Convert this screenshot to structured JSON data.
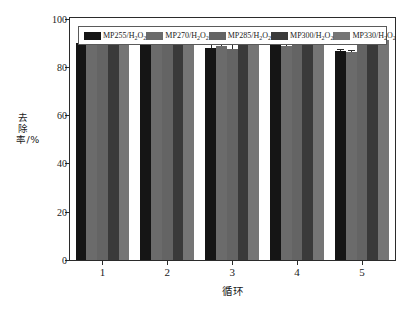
{
  "chart_data": {
    "type": "bar",
    "title": "",
    "xlabel": "循环",
    "ylabel": "去除率/%",
    "categories": [
      "1",
      "2",
      "3",
      "4",
      "5"
    ],
    "ylim": [
      0,
      100
    ],
    "yticks": [
      0,
      20,
      40,
      60,
      80,
      100
    ],
    "grid": false,
    "legend_position": "top-inside",
    "series": [
      {
        "name": "MP255/H₂O₂",
        "name_base": "MP255/H",
        "name_sub": "2",
        "name_tail": "O",
        "name_sub2": "2",
        "color": "#151515",
        "values": [
          90.0,
          91.5,
          88.0,
          92.5,
          86.5
        ],
        "errors": [
          3.0,
          0.6,
          1.5,
          0.5,
          0.6
        ]
      },
      {
        "name": "MP270/H₂O₂",
        "name_base": "MP270/H",
        "name_sub": "2",
        "name_tail": "O",
        "name_sub2": "2",
        "color": "#6b6b6b",
        "values": [
          90.5,
          90.5,
          88.5,
          88.5,
          86.0
        ],
        "errors": [
          2.0,
          0.4,
          1.3,
          1.6,
          0.5
        ]
      },
      {
        "name": "MP285/H₂O₂",
        "name_base": "MP285/H",
        "name_sub": "2",
        "name_tail": "O",
        "name_sub2": "2",
        "color": "#646464",
        "values": [
          91.0,
          91.5,
          87.5,
          92.0,
          89.0
        ],
        "errors": [
          1.3,
          0.5,
          3.0,
          0.8,
          1.6
        ]
      },
      {
        "name": "MP300/H₂O₂",
        "name_base": "MP300/H",
        "name_sub": "2",
        "name_tail": "O",
        "name_sub2": "2",
        "color": "#3a3a3a",
        "values": [
          92.5,
          92.0,
          92.0,
          91.0,
          90.0
        ],
        "errors": [
          0.9,
          0.5,
          1.3,
          1.5,
          2.0
        ]
      },
      {
        "name": "MP330/H₂O₂",
        "name_base": "MP330/H",
        "name_sub": "2",
        "name_tail": "O",
        "name_sub2": "2",
        "color": "#757575",
        "values": [
          93.0,
          92.0,
          93.0,
          89.0,
          91.0
        ],
        "errors": [
          0.6,
          0.5,
          0.5,
          0.4,
          2.0
        ]
      }
    ]
  },
  "axes": {
    "y_label": "去除率/%",
    "x_label": "循环",
    "y_tick_labels": [
      "0",
      "20",
      "40",
      "60",
      "80",
      "100"
    ],
    "x_tick_labels": [
      "1",
      "2",
      "3",
      "4",
      "5"
    ]
  },
  "colors": {
    "frame": "#2b2b2b",
    "background": "#ffffff",
    "text": "#1a1a1a"
  }
}
